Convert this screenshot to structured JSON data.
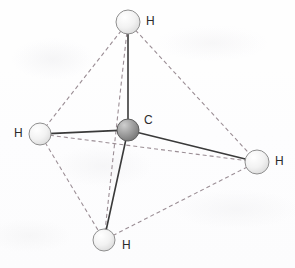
{
  "figure": {
    "kind": "molecular-structure-diagram",
    "molecule_name": "methane",
    "geometry": "tetrahedral",
    "background_color": "#fefefe"
  },
  "style": {
    "bond_color": "#3a3a3a",
    "bond_width": 1.6,
    "edge_color": "#9b8e95",
    "edge_width": 1.1,
    "edge_dash": "4,3",
    "carbon_fill_light": "#c9c9c9",
    "carbon_fill_dark": "#7d7d7d",
    "carbon_stroke": "#5e5e5e",
    "hydrogen_fill_light": "#fbfbfb",
    "hydrogen_fill_dark": "#dcdcdc",
    "hydrogen_stroke": "#8f8f8f",
    "label_color": "#2b2b2b"
  },
  "atoms": [
    {
      "id": "carbon-center",
      "element": "C",
      "label": "C",
      "cx": 128,
      "cy": 130,
      "r": 11,
      "kind": "carbon",
      "label_x": 144,
      "label_y": 114
    },
    {
      "id": "hydrogen-top",
      "element": "H",
      "label": "H",
      "cx": 128,
      "cy": 22,
      "r": 12,
      "kind": "hydrogen",
      "label_x": 146,
      "label_y": 15
    },
    {
      "id": "hydrogen-left",
      "element": "H",
      "label": "H",
      "cx": 40,
      "cy": 134,
      "r": 11,
      "kind": "hydrogen",
      "label_x": 14,
      "label_y": 127
    },
    {
      "id": "hydrogen-right",
      "element": "H",
      "label": "H",
      "cx": 257,
      "cy": 162,
      "r": 12,
      "kind": "hydrogen",
      "label_x": 275,
      "label_y": 155
    },
    {
      "id": "hydrogen-bottom",
      "element": "H",
      "label": "H",
      "cx": 104,
      "cy": 240,
      "r": 11,
      "kind": "hydrogen",
      "label_x": 122,
      "label_y": 239
    }
  ],
  "bonds": [
    {
      "id": "bond-c-h-top",
      "from": "carbon-center",
      "to": "hydrogen-top",
      "style": "solid"
    },
    {
      "id": "bond-c-h-left",
      "from": "carbon-center",
      "to": "hydrogen-left",
      "style": "solid"
    },
    {
      "id": "bond-c-h-right",
      "from": "carbon-center",
      "to": "hydrogen-right",
      "style": "solid"
    },
    {
      "id": "bond-c-h-bottom",
      "from": "carbon-center",
      "to": "hydrogen-bottom",
      "style": "solid"
    }
  ],
  "tetrahedron_edges": [
    {
      "id": "edge-top-left",
      "from": "hydrogen-top",
      "to": "hydrogen-left",
      "style": "dashed"
    },
    {
      "id": "edge-top-right",
      "from": "hydrogen-top",
      "to": "hydrogen-right",
      "style": "dashed"
    },
    {
      "id": "edge-top-bottom",
      "from": "hydrogen-top",
      "to": "hydrogen-bottom",
      "style": "dashed"
    },
    {
      "id": "edge-left-right",
      "from": "hydrogen-left",
      "to": "hydrogen-right",
      "style": "dashed"
    },
    {
      "id": "edge-left-bottom",
      "from": "hydrogen-left",
      "to": "hydrogen-bottom",
      "style": "dashed"
    },
    {
      "id": "edge-bottom-right",
      "from": "hydrogen-bottom",
      "to": "hydrogen-right",
      "style": "dashed"
    }
  ]
}
